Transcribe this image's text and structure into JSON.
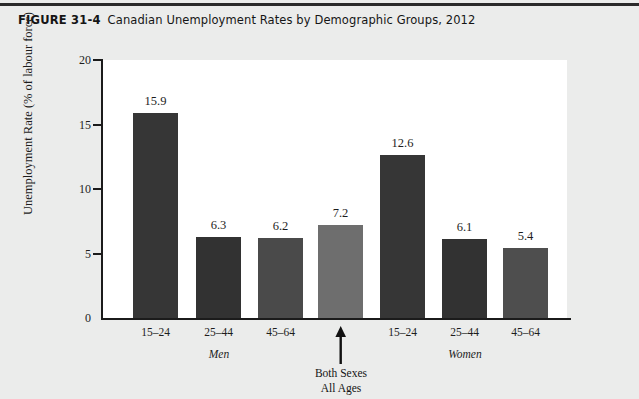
{
  "figure": {
    "number": "FIGURE 31-4",
    "title": "Canadian Unemployment Rates by Demographic Groups, 2012"
  },
  "chart_data": {
    "type": "bar",
    "title": "Canadian Unemployment Rates by Demographic Groups, 2012",
    "xlabel": "",
    "ylabel": "Unemployment Rate (% of labour force)",
    "ylim": [
      0,
      20
    ],
    "yticks": [
      0,
      5,
      10,
      15,
      20
    ],
    "ytick_labels": [
      "0",
      "5",
      "10",
      "15",
      "20"
    ],
    "grid": false,
    "legend": "none",
    "categories": [
      "15–24",
      "25–44",
      "45–64",
      "Both Sexes All Ages",
      "15–24",
      "25–44",
      "45–64"
    ],
    "values": [
      15.9,
      6.3,
      6.2,
      7.2,
      12.6,
      6.1,
      5.4
    ],
    "value_labels": [
      "15.9",
      "6.3",
      "6.2",
      "7.2",
      "12.6",
      "6.1",
      "5.4"
    ],
    "bars": [
      {
        "label": "15–24",
        "value": 15.9,
        "value_label": "15.9",
        "group": "Men",
        "color": "#363636",
        "x": 133,
        "width": 45
      },
      {
        "label": "25–44",
        "value": 6.3,
        "value_label": "6.3",
        "group": "Men",
        "color": "#323232",
        "x": 196,
        "width": 45
      },
      {
        "label": "45–64",
        "value": 6.2,
        "value_label": "6.2",
        "group": "Men",
        "color": "#4a4a4a",
        "x": 258,
        "width": 45
      },
      {
        "label": "Both Sexes All Ages",
        "value": 7.2,
        "value_label": "7.2",
        "group": "Both Sexes All Ages",
        "color": "#6e6e6e",
        "x": 318,
        "width": 45
      },
      {
        "label": "15–24",
        "value": 12.6,
        "value_label": "12.6",
        "group": "Women",
        "color": "#363636",
        "x": 380,
        "width": 45
      },
      {
        "label": "25–44",
        "value": 6.1,
        "value_label": "6.1",
        "group": "Women",
        "color": "#323232",
        "x": 442,
        "width": 45
      },
      {
        "label": "45–64",
        "value": 5.4,
        "value_label": "5.4",
        "group": "Women",
        "color": "#4e4e4e",
        "x": 503,
        "width": 45
      }
    ],
    "group_labels": [
      {
        "text": "Men",
        "center": 219
      },
      {
        "text": "Women",
        "center": 465
      }
    ],
    "annotations": [
      {
        "text_line1": "Both Sexes",
        "text_line2": "All Ages",
        "arrow": "up-arrow",
        "center": 341
      }
    ]
  },
  "colors": {
    "page_background": "#ebeceb",
    "plot_background": "#ffffff",
    "axis": "#1b1b1b",
    "text": "#1d1d1d",
    "bar_dark": "#363636",
    "bar_mid": "#4a4a4a",
    "bar_light": "#6e6e6e"
  }
}
